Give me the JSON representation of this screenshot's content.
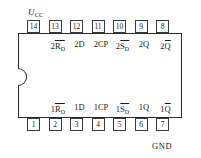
{
  "diagram": {
    "vcc_label": "U",
    "vcc_subscript": "CC",
    "gnd_label": "GND",
    "body_color": "#ffffff",
    "line_color": "#2b2b2b"
  },
  "pins_top": [
    {
      "number": "14"
    },
    {
      "number": "13"
    },
    {
      "number": "12"
    },
    {
      "number": "11"
    },
    {
      "number": "10"
    },
    {
      "number": "9"
    },
    {
      "number": "8"
    }
  ],
  "pins_bottom": [
    {
      "number": "1"
    },
    {
      "number": "2"
    },
    {
      "number": "3"
    },
    {
      "number": "4"
    },
    {
      "number": "5"
    },
    {
      "number": "6"
    },
    {
      "number": "7"
    }
  ],
  "signals_top": [
    {
      "prefix": "2",
      "name": "R",
      "overline": true,
      "subscript": "D"
    },
    {
      "prefix": "2",
      "name": "D",
      "overline": false,
      "subscript": ""
    },
    {
      "prefix": "2",
      "name": "CP",
      "overline": false,
      "subscript": ""
    },
    {
      "prefix": "2",
      "name": "S",
      "overline": true,
      "subscript": "D"
    },
    {
      "prefix": "2",
      "name": "Q",
      "overline": false,
      "subscript": ""
    },
    {
      "prefix": "2",
      "name": "Q",
      "overline": true,
      "subscript": ""
    }
  ],
  "signals_bottom": [
    {
      "prefix": "1",
      "name": "R",
      "overline": true,
      "subscript": "D"
    },
    {
      "prefix": "1",
      "name": "D",
      "overline": false,
      "subscript": ""
    },
    {
      "prefix": "1",
      "name": "CP",
      "overline": false,
      "subscript": ""
    },
    {
      "prefix": "1",
      "name": "S",
      "overline": true,
      "subscript": "D"
    },
    {
      "prefix": "1",
      "name": "Q",
      "overline": false,
      "subscript": ""
    },
    {
      "prefix": "1",
      "name": "Q",
      "overline": true,
      "subscript": ""
    }
  ],
  "geometry": {
    "pin_start_x": 27,
    "pin_step_x": 21.5,
    "signal_start_x": 58,
    "signal_step_x": 21.5
  }
}
